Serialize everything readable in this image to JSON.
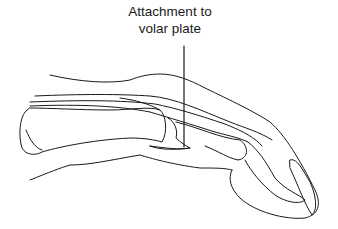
{
  "figure": {
    "annotation": {
      "line1": "Attachment to",
      "line2": "volar plate"
    },
    "colors": {
      "ink": "#1a1a1a",
      "background": "#ffffff"
    }
  }
}
